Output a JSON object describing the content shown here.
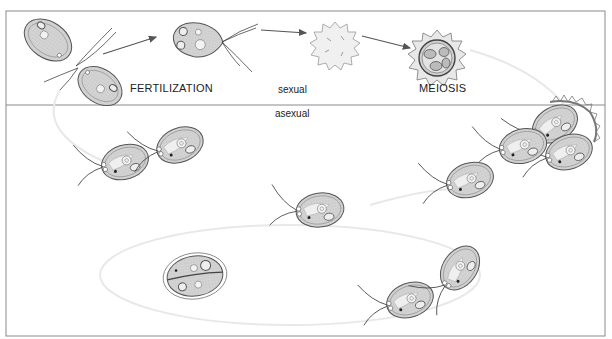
{
  "diagram": {
    "panels": {
      "top": {
        "label": "sexual"
      },
      "bottom": {
        "label": "asexual"
      }
    },
    "labels": {
      "fertilization": "FERTILIZATION",
      "meiosis": "MEIOSIS",
      "sexual": "sexual",
      "asexual": "asexual"
    },
    "stages": [
      {
        "id": "gametes-pairing",
        "panel": "sexual"
      },
      {
        "id": "zygote-flagellated",
        "panel": "sexual"
      },
      {
        "id": "zygospore",
        "panel": "sexual"
      },
      {
        "id": "meiosis-zygospore",
        "panel": "sexual"
      },
      {
        "id": "released-cells",
        "panel": "asexual"
      },
      {
        "id": "single-cell",
        "panel": "asexual"
      },
      {
        "id": "dividing-cell",
        "panel": "asexual"
      },
      {
        "id": "daughter-cells",
        "panel": "asexual"
      }
    ],
    "colors": {
      "border": "#8a8a8a",
      "cell_fill": "#d6d6d6",
      "cell_stroke": "#555555",
      "arrow": "#555555",
      "cycle_arc": "#e6e6e6"
    }
  }
}
